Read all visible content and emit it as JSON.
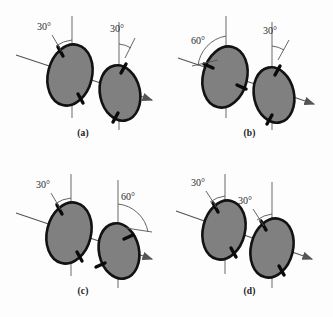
{
  "figure": {
    "background_color": "#fdfdfd",
    "disk_fill_color": "#808080",
    "disk_stroke_color": "#121212",
    "line_color": "#555555",
    "axis_tick_color": "#0a0a0a",
    "degree_symbol": "°"
  },
  "panels": [
    {
      "id": "a",
      "caption": "(a)",
      "polarizers": [
        {
          "position": "left",
          "angle_label": "30°",
          "angle_value": 30,
          "tilt_direction": "left",
          "reference": "vertical"
        },
        {
          "position": "right",
          "angle_label": "30°",
          "angle_value": 30,
          "tilt_direction": "right",
          "reference": "vertical"
        }
      ]
    },
    {
      "id": "b",
      "caption": "(b)",
      "polarizers": [
        {
          "position": "left",
          "angle_label": "60°",
          "angle_value": 60,
          "tilt_direction": "left",
          "reference": "vertical"
        },
        {
          "position": "right",
          "angle_label": "30°",
          "angle_value": 30,
          "tilt_direction": "right",
          "reference": "vertical"
        }
      ]
    },
    {
      "id": "c",
      "caption": "(c)",
      "polarizers": [
        {
          "position": "left",
          "angle_label": "30°",
          "angle_value": 30,
          "tilt_direction": "left",
          "reference": "vertical"
        },
        {
          "position": "right",
          "angle_label": "60°",
          "angle_value": 60,
          "tilt_direction": "right",
          "reference": "vertical"
        }
      ]
    },
    {
      "id": "d",
      "caption": "(d)",
      "polarizers": [
        {
          "position": "left",
          "angle_label": "30°",
          "angle_value": 30,
          "tilt_direction": "left",
          "reference": "vertical"
        },
        {
          "position": "right",
          "angle_label": "30°",
          "angle_value": 30,
          "tilt_direction": "left",
          "reference": "vertical"
        }
      ]
    }
  ]
}
